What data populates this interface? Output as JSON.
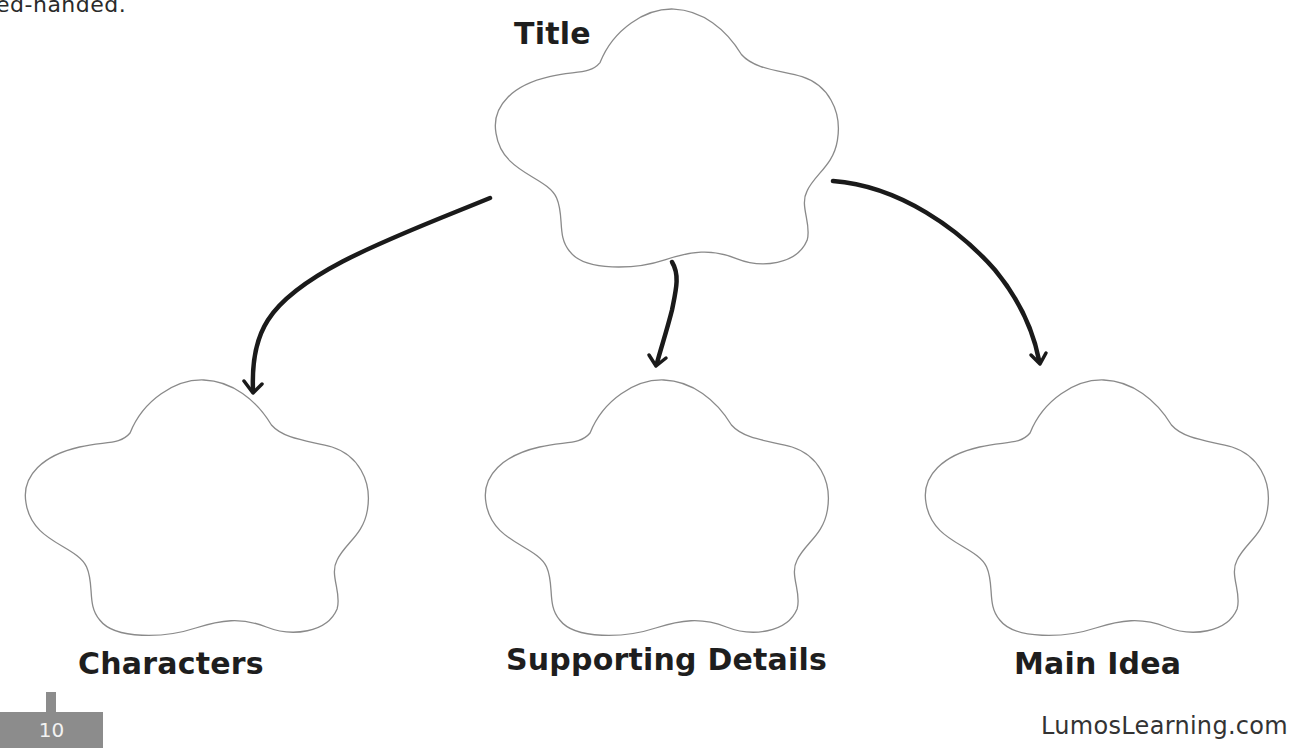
{
  "page": {
    "intro_fragment": "ed-handed.",
    "page_number": "10",
    "footer_site": "LumosLearning.com"
  },
  "diagram": {
    "type": "graphic-organizer",
    "root": {
      "id": "title",
      "label": "Title"
    },
    "children": [
      {
        "id": "characters",
        "label": "Characters"
      },
      {
        "id": "supporting-details",
        "label": "Supporting Details"
      },
      {
        "id": "main-idea",
        "label": "Main Idea"
      }
    ],
    "edges": [
      {
        "from": "title",
        "to": "characters"
      },
      {
        "from": "title",
        "to": "supporting-details"
      },
      {
        "from": "title",
        "to": "main-idea"
      }
    ]
  },
  "colors": {
    "cloud_stroke": "#8a8a8a",
    "arrow": "#1a1a1a",
    "page_badge": "#8c8c8c",
    "text": "#1e1e1e"
  }
}
